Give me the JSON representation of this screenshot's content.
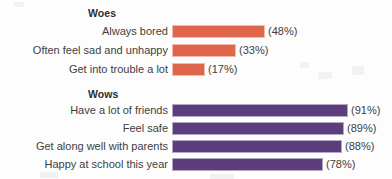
{
  "chart_data": {
    "type": "bar",
    "title": "",
    "xlabel": "",
    "ylabel": "",
    "orientation": "horizontal",
    "grid": false,
    "legend": "none",
    "xlim": [
      0,
      100
    ],
    "value_suffix": "%",
    "groups": [
      {
        "name": "Woes",
        "color": "#E0664B",
        "categories": [
          "Always bored",
          "Often feel sad and unhappy",
          "Get into trouble a lot"
        ],
        "values": [
          48,
          33,
          17
        ],
        "value_labels": [
          "(48%)",
          "(33%)",
          "(17%)"
        ]
      },
      {
        "name": "Wows",
        "color": "#5C3E7C",
        "categories": [
          "Have a lot of friends",
          "Feel safe",
          "Get along well with parents",
          "Happy at school this year"
        ],
        "values": [
          91,
          89,
          88,
          78
        ],
        "value_labels": [
          "(91%)",
          "(89%)",
          "(88%)",
          "(78%)"
        ]
      }
    ]
  },
  "headers": {
    "woes": "Woes",
    "wows": "Wows"
  },
  "rows": {
    "woes": [
      {
        "label": "Always bored",
        "value_label": "(48%)"
      },
      {
        "label": "Often feel sad and unhappy",
        "value_label": "(33%)"
      },
      {
        "label": "Get into trouble a lot",
        "value_label": "(17%)"
      }
    ],
    "wows": [
      {
        "label": "Have a lot of friends",
        "value_label": "(91%)"
      },
      {
        "label": "Feel safe",
        "value_label": "(89%)"
      },
      {
        "label": "Get along well with parents",
        "value_label": "(88%)"
      },
      {
        "label": "Happy at school this year",
        "value_label": "(78%)"
      }
    ]
  }
}
